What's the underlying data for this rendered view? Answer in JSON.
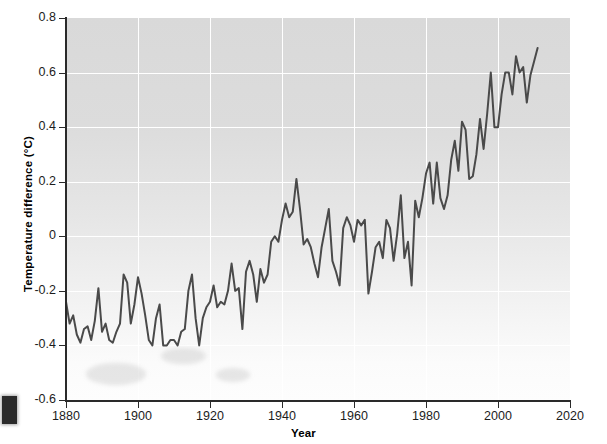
{
  "chart_data": {
    "type": "line",
    "title": "",
    "xlabel": "Year",
    "ylabel": "Temperature difference (°C)",
    "xlim": [
      1880,
      2020
    ],
    "ylim": [
      -0.6,
      0.8
    ],
    "xticks": [
      1880,
      1900,
      1920,
      1940,
      1960,
      1980,
      2000,
      2020
    ],
    "xtick_labels": [
      "1880",
      "1900",
      "1920",
      "1940",
      "1960",
      "1980",
      "2000",
      "2020"
    ],
    "yticks": [
      -0.6,
      -0.4,
      -0.2,
      0,
      0.2,
      0.4,
      0.6,
      0.8
    ],
    "ytick_labels": [
      "-0.6",
      "-0.4",
      "-0.2",
      "0",
      "0.2",
      "0.4",
      "0.6",
      "0.8"
    ],
    "grid": true,
    "grid_color": "#ffffff",
    "legend": false,
    "line_color": "#4a4a4a",
    "line_width": 2.0,
    "plot_bg": "#e0e0e0",
    "series": [
      {
        "name": "Global temperature difference",
        "x": [
          1880,
          1881,
          1882,
          1883,
          1884,
          1885,
          1886,
          1887,
          1888,
          1889,
          1890,
          1891,
          1892,
          1893,
          1894,
          1895,
          1896,
          1897,
          1898,
          1899,
          1900,
          1901,
          1902,
          1903,
          1904,
          1905,
          1906,
          1907,
          1908,
          1909,
          1910,
          1911,
          1912,
          1913,
          1914,
          1915,
          1916,
          1917,
          1918,
          1919,
          1920,
          1921,
          1922,
          1923,
          1924,
          1925,
          1926,
          1927,
          1928,
          1929,
          1930,
          1931,
          1932,
          1933,
          1934,
          1935,
          1936,
          1937,
          1938,
          1939,
          1940,
          1941,
          1942,
          1943,
          1944,
          1945,
          1946,
          1947,
          1948,
          1949,
          1950,
          1951,
          1952,
          1953,
          1954,
          1955,
          1956,
          1957,
          1958,
          1959,
          1960,
          1961,
          1962,
          1963,
          1964,
          1965,
          1966,
          1967,
          1968,
          1969,
          1970,
          1971,
          1972,
          1973,
          1974,
          1975,
          1976,
          1977,
          1978,
          1979,
          1980,
          1981,
          1982,
          1983,
          1984,
          1985,
          1986,
          1987,
          1988,
          1989,
          1990,
          1991,
          1992,
          1993,
          1994,
          1995,
          1996,
          1997,
          1998,
          1999,
          2000,
          2001,
          2002,
          2003,
          2004,
          2005,
          2006,
          2007,
          2008,
          2009,
          2010,
          2011
        ],
        "y": [
          -0.24,
          -0.32,
          -0.29,
          -0.36,
          -0.39,
          -0.34,
          -0.33,
          -0.38,
          -0.31,
          -0.19,
          -0.35,
          -0.32,
          -0.38,
          -0.39,
          -0.35,
          -0.32,
          -0.14,
          -0.17,
          -0.32,
          -0.25,
          -0.15,
          -0.21,
          -0.29,
          -0.38,
          -0.4,
          -0.3,
          -0.25,
          -0.4,
          -0.4,
          -0.38,
          -0.38,
          -0.4,
          -0.35,
          -0.34,
          -0.2,
          -0.14,
          -0.3,
          -0.4,
          -0.3,
          -0.26,
          -0.24,
          -0.18,
          -0.26,
          -0.24,
          -0.25,
          -0.2,
          -0.1,
          -0.2,
          -0.19,
          -0.34,
          -0.13,
          -0.09,
          -0.14,
          -0.24,
          -0.12,
          -0.17,
          -0.14,
          -0.02,
          0.0,
          -0.02,
          0.06,
          0.12,
          0.07,
          0.09,
          0.21,
          0.1,
          -0.03,
          -0.01,
          -0.04,
          -0.1,
          -0.15,
          -0.04,
          0.03,
          0.1,
          -0.09,
          -0.13,
          -0.18,
          0.03,
          0.07,
          0.04,
          -0.02,
          0.06,
          0.04,
          0.06,
          -0.21,
          -0.13,
          -0.04,
          -0.02,
          -0.08,
          0.06,
          0.03,
          -0.09,
          0.01,
          0.15,
          -0.08,
          -0.02,
          -0.18,
          0.13,
          0.07,
          0.14,
          0.23,
          0.27,
          0.12,
          0.27,
          0.14,
          0.1,
          0.15,
          0.28,
          0.35,
          0.24,
          0.42,
          0.39,
          0.21,
          0.22,
          0.3,
          0.43,
          0.32,
          0.45,
          0.6,
          0.4,
          0.4,
          0.52,
          0.6,
          0.6,
          0.52,
          0.66,
          0.6,
          0.62,
          0.49,
          0.59,
          0.64,
          0.69
        ]
      }
    ]
  },
  "artifacts": {
    "left_block": "scan-artifact",
    "blotches": "paper-smudge"
  }
}
